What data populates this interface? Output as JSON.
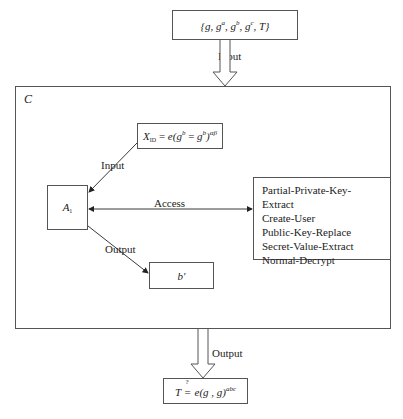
{
  "top_box": {
    "text": "{g, g^a, g^b, g^c, T}",
    "parts": {
      "open": "{",
      "g1": "g",
      "g2": "g",
      "a": "a",
      "g3": "g",
      "b": "b",
      "g4": "g",
      "c": "c",
      "T": "T",
      "close": "}"
    }
  },
  "arrows": {
    "input_top": "Input",
    "output_bottom": "Output",
    "input_inner": "Input",
    "access": "Access",
    "output_inner": "Output"
  },
  "container": {
    "label": "C"
  },
  "xid_box": {
    "text": "X_ID = e(g^b = g^b)^αβ",
    "X": "X",
    "sub": "ID",
    "eq": " = e(g",
    "b1": "b",
    "mid": " = g",
    "b2": "b",
    "close": ")",
    "exp": "αβ"
  },
  "a1_box": {
    "A": "A",
    "sub": "1"
  },
  "oracle_box": {
    "items": [
      "Partial-Private-Key-Extract",
      "Create-User",
      "Public-Key-Replace",
      "Secret-Value-Extract",
      "Normal-Decrypt"
    ]
  },
  "bprime_box": {
    "text": "b′"
  },
  "bottom_box": {
    "text": "T ≟ e(g, g)^abc",
    "lhs": "T",
    "q": "?",
    "eq": "=",
    "rhs": " e(g , g)",
    "exp": "abc"
  },
  "colors": {
    "line": "#555555",
    "text": "#222222",
    "background": "#ffffff"
  }
}
